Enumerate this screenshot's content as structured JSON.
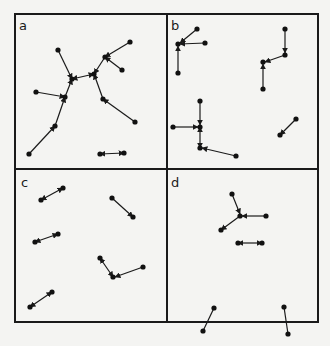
{
  "figure": {
    "panels": [
      {
        "label": "a",
        "label_pos": [
          19,
          30
        ],
        "points": [
          [
            58,
            50
          ],
          [
            130,
            42
          ],
          [
            105,
            57
          ],
          [
            122,
            70
          ],
          [
            94,
            74
          ],
          [
            72,
            79
          ],
          [
            36,
            92
          ],
          [
            65,
            97
          ],
          [
            103,
            99
          ],
          [
            55,
            126
          ],
          [
            135,
            122
          ],
          [
            29,
            154
          ],
          [
            100,
            154
          ],
          [
            124,
            153
          ]
        ],
        "edges": [
          {
            "from": [
              58,
              50
            ],
            "to": [
              72,
              79
            ],
            "arrow": "end"
          },
          {
            "from": [
              130,
              42
            ],
            "to": [
              105,
              57
            ],
            "arrow": "end"
          },
          {
            "from": [
              122,
              70
            ],
            "to": [
              105,
              57
            ],
            "arrow": "end"
          },
          {
            "from": [
              105,
              57
            ],
            "to": [
              94,
              74
            ],
            "arrow": "end"
          },
          {
            "from": [
              94,
              74
            ],
            "to": [
              72,
              79
            ],
            "arrow": "both"
          },
          {
            "from": [
              36,
              92
            ],
            "to": [
              65,
              97
            ],
            "arrow": "end"
          },
          {
            "from": [
              65,
              97
            ],
            "to": [
              72,
              79
            ],
            "arrow": "end"
          },
          {
            "from": [
              103,
              99
            ],
            "to": [
              94,
              74
            ],
            "arrow": "end"
          },
          {
            "from": [
              135,
              122
            ],
            "to": [
              103,
              99
            ],
            "arrow": "end"
          },
          {
            "from": [
              55,
              126
            ],
            "to": [
              65,
              97
            ],
            "arrow": "end"
          },
          {
            "from": [
              29,
              154
            ],
            "to": [
              55,
              126
            ],
            "arrow": "end"
          },
          {
            "from": [
              100,
              154
            ],
            "to": [
              124,
              153
            ],
            "arrow": "both"
          }
        ]
      },
      {
        "label": "b",
        "label_pos": [
          171,
          30
        ],
        "points": [
          [
            197,
            29
          ],
          [
            205,
            43
          ],
          [
            178,
            44
          ],
          [
            178,
            73
          ],
          [
            285,
            29
          ],
          [
            285,
            55
          ],
          [
            263,
            62
          ],
          [
            263,
            89
          ],
          [
            200,
            101
          ],
          [
            200,
            127
          ],
          [
            173,
            127
          ],
          [
            200,
            148
          ],
          [
            236,
            156
          ],
          [
            296,
            119
          ],
          [
            280,
            135
          ]
        ],
        "edges": [
          {
            "from": [
              197,
              29
            ],
            "to": [
              180,
              43
            ],
            "arrow": "end"
          },
          {
            "from": [
              205,
              43
            ],
            "to": [
              180,
              44
            ],
            "arrow": "end"
          },
          {
            "from": [
              178,
              73
            ],
            "to": [
              178,
              46
            ],
            "arrow": "end"
          },
          {
            "from": [
              285,
              29
            ],
            "to": [
              285,
              53
            ],
            "arrow": "end"
          },
          {
            "from": [
              285,
              55
            ],
            "to": [
              265,
              62
            ],
            "arrow": "end"
          },
          {
            "from": [
              263,
              89
            ],
            "to": [
              263,
              64
            ],
            "arrow": "end"
          },
          {
            "from": [
              200,
              101
            ],
            "to": [
              200,
              125
            ],
            "arrow": "end"
          },
          {
            "from": [
              173,
              127
            ],
            "to": [
              198,
              127
            ],
            "arrow": "end"
          },
          {
            "from": [
              200,
              127
            ],
            "to": [
              200,
              148
            ],
            "arrow": "both"
          },
          {
            "from": [
              236,
              156
            ],
            "to": [
              202,
              148
            ],
            "arrow": "end"
          },
          {
            "from": [
              296,
              119
            ],
            "to": [
              280,
              135
            ],
            "arrow": "end"
          }
        ]
      },
      {
        "label": "c",
        "label_pos": [
          21,
          187
        ],
        "points": [
          [
            41,
            200
          ],
          [
            63,
            188
          ],
          [
            112,
            198
          ],
          [
            133,
            217
          ],
          [
            35,
            242
          ],
          [
            58,
            234
          ],
          [
            100,
            258
          ],
          [
            113,
            277
          ],
          [
            143,
            267
          ],
          [
            30,
            307
          ],
          [
            52,
            292
          ]
        ],
        "edges": [
          {
            "from": [
              41,
              200
            ],
            "to": [
              63,
              188
            ],
            "arrow": "both"
          },
          {
            "from": [
              112,
              198
            ],
            "to": [
              133,
              217
            ],
            "arrow": "end"
          },
          {
            "from": [
              35,
              242
            ],
            "to": [
              58,
              234
            ],
            "arrow": "both"
          },
          {
            "from": [
              100,
              258
            ],
            "to": [
              113,
              277
            ],
            "arrow": "both"
          },
          {
            "from": [
              143,
              267
            ],
            "to": [
              115,
              277
            ],
            "arrow": "end"
          },
          {
            "from": [
              30,
              307
            ],
            "to": [
              52,
              292
            ],
            "arrow": "both"
          }
        ]
      },
      {
        "label": "d",
        "label_pos": [
          171,
          187
        ],
        "points": [
          [
            232,
            194
          ],
          [
            240,
            216
          ],
          [
            266,
            216
          ],
          [
            221,
            230
          ],
          [
            238,
            243
          ],
          [
            262,
            243
          ],
          [
            214,
            308
          ],
          [
            203,
            331
          ],
          [
            284,
            307
          ],
          [
            288,
            334
          ]
        ],
        "edges": [
          {
            "from": [
              232,
              194
            ],
            "to": [
              240,
              214
            ],
            "arrow": "end"
          },
          {
            "from": [
              266,
              216
            ],
            "to": [
              242,
              216
            ],
            "arrow": "end"
          },
          {
            "from": [
              240,
              216
            ],
            "to": [
              221,
              230
            ],
            "arrow": "end"
          },
          {
            "from": [
              238,
              243
            ],
            "to": [
              262,
              243
            ],
            "arrow": "both"
          },
          {
            "from": [
              214,
              308
            ],
            "to": [
              203,
              331
            ],
            "arrow": "none"
          },
          {
            "from": [
              284,
              307
            ],
            "to": [
              288,
              334
            ],
            "arrow": "none"
          }
        ]
      }
    ],
    "frame": {
      "x": 15,
      "y": 14,
      "w": 303,
      "h": 308
    },
    "dividers": {
      "vx": 167,
      "hy": 169
    }
  }
}
